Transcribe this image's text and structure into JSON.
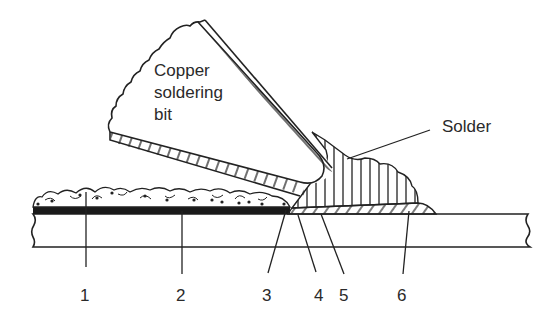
{
  "diagram": {
    "labels": {
      "bit_line1": "Copper",
      "bit_line2": "soldering",
      "bit_line3": "bit",
      "solder": "Solder"
    },
    "numbers": [
      {
        "id": "1",
        "text": "1",
        "x": 85
      },
      {
        "id": "2",
        "text": "2",
        "x": 182
      },
      {
        "id": "3",
        "text": "3",
        "x": 268
      },
      {
        "id": "4",
        "text": "4",
        "x": 320
      },
      {
        "id": "5",
        "text": "5",
        "x": 345
      },
      {
        "id": "6",
        "text": "6",
        "x": 403
      }
    ],
    "colors": {
      "line": "#222222",
      "background": "#ffffff",
      "oxide": "#1a1a1a"
    }
  }
}
